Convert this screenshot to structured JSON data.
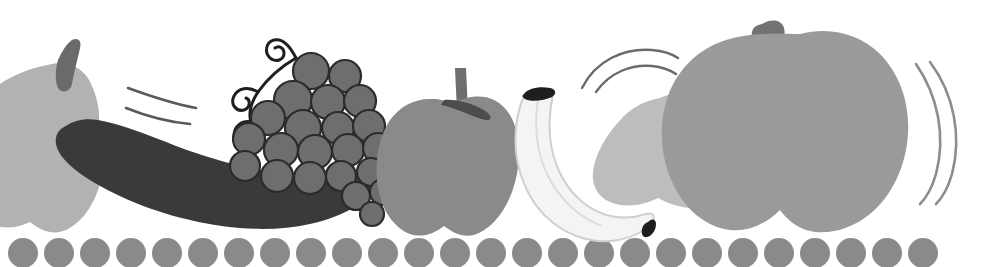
{
  "image": {
    "kind": "illustration",
    "subject": "row-of-fruit-with-motion-lines",
    "title": "Fruit row illustration",
    "width": 1003,
    "height": 267,
    "background_color": "#ffffff",
    "style": "flat grayscale halftone clip-art"
  },
  "palette": {
    "background": "#ffffff",
    "very_light_gray": "#f4f4f2",
    "light_gray": "#bdbdbd",
    "pale_gray": "#b2b2b2",
    "mid_gray": "#9a9a9a",
    "apple_gray": "#8a8a8a",
    "dot_gray": "#8a8a8a",
    "grape_gray": "#6e6e6e",
    "stem_gray": "#707070",
    "dark_gray": "#3a3a3a",
    "near_black": "#2b2b2b",
    "line_gray": "#6b6b6b",
    "outline_gray": "#cfcfcf"
  },
  "objects": [
    {
      "id": "left-apple",
      "name": "apple-left-cropped",
      "label": "Light gray apple cropped by left edge",
      "fill": "#b2b2b2",
      "stem_fill": "#6a6a6a",
      "x": 0,
      "y": 60,
      "width": 108,
      "height": 170
    },
    {
      "id": "left-speed-lines",
      "name": "motion-lines-left",
      "label": "Two curved motion lines",
      "stroke": "#595959",
      "count": 2,
      "x": 122,
      "y": 82,
      "width": 80,
      "height": 42
    },
    {
      "id": "eggplant",
      "name": "dark-banana",
      "label": "Dark curved elongated fruit",
      "fill": "#3a3a3a",
      "x": 58,
      "y": 118,
      "width": 320,
      "height": 110
    },
    {
      "id": "grapes",
      "name": "grape-cluster",
      "label": "Cluster of grapes with curling tendrils",
      "berry_fill": "#6e6e6e",
      "berry_outline": "#2b2b2b",
      "tendril_stroke": "#1f1f1f",
      "berry_count": 22,
      "x": 228,
      "y": 34,
      "width": 172,
      "height": 185
    },
    {
      "id": "center-apple",
      "name": "apple-center",
      "label": "Medium gray apple with stem",
      "fill": "#8a8a8a",
      "stem_fill": "#6e6e6e",
      "x": 388,
      "y": 66,
      "width": 132,
      "height": 172
    },
    {
      "id": "banana",
      "name": "banana-pale",
      "label": "Pale banana with dark tips",
      "fill": "#f4f4f2",
      "outline": "#c9c9c9",
      "tip_fill": "#1e1e1e",
      "x": 500,
      "y": 86,
      "width": 160,
      "height": 158
    },
    {
      "id": "pear-arcs",
      "name": "motion-lines-top",
      "label": "Two arc motion lines above the pear",
      "stroke": "#6b6b6b",
      "count": 2,
      "x": 578,
      "y": 46,
      "width": 100,
      "height": 46
    },
    {
      "id": "pear",
      "name": "pear-light",
      "label": "Light gray pear with dark stem",
      "fill": "#bdbdbd",
      "stem_fill": "#7a7a7a",
      "x": 596,
      "y": 94,
      "width": 160,
      "height": 140
    },
    {
      "id": "right-apple",
      "name": "apple-right-large",
      "label": "Large gray apple with stem",
      "fill": "#9a9a9a",
      "stem_fill": "#737373",
      "x": 702,
      "y": 18,
      "width": 208,
      "height": 216
    },
    {
      "id": "right-speed-lines",
      "name": "motion-lines-right",
      "label": "Two vertical curved motion lines",
      "stroke": "#8d8d8d",
      "count": 2,
      "x": 912,
      "y": 62,
      "width": 52,
      "height": 140
    },
    {
      "id": "dot-row",
      "name": "bottom-dot-row",
      "label": "Row of gray circles along bottom edge",
      "fill": "#8a8a8a",
      "count": 26,
      "diameter": 30,
      "spacing": 36,
      "first_center_x": 23,
      "center_y": 253
    }
  ]
}
